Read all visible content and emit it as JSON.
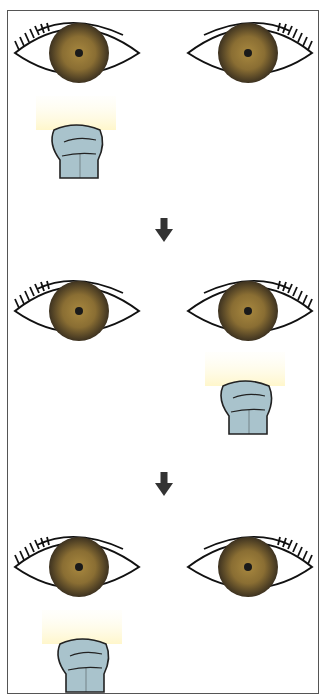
{
  "diagram": {
    "title": "",
    "colors": {
      "iris_outer": "#4a3d22",
      "iris_inner": "#9c7d3a",
      "pupil": "#1a1a1a",
      "outline": "#111111",
      "light_beam": "#fffbe0",
      "flashlight_fill": "#a9c3cc",
      "flashlight_stroke": "#222222",
      "arrow": "#333333",
      "frame": "#555555"
    },
    "panels": [
      {
        "step": 1,
        "light_target": "left-eye"
      },
      {
        "step": 2,
        "light_target": "right-eye"
      },
      {
        "step": 3,
        "light_target": "left-eye"
      }
    ],
    "arrows": [
      {
        "direction": "down"
      },
      {
        "direction": "down"
      }
    ]
  }
}
